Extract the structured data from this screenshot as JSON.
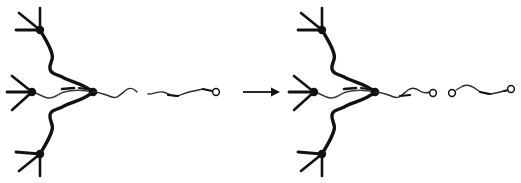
{
  "figure": {
    "title": "Polymer Chain-End Functionalization Reaction Scheme",
    "type": "hand-drawn reaction scheme",
    "background_color": "#ffffff",
    "ink_color": "#111111",
    "faint_ink_color": "#555555",
    "panel_count": 2,
    "operator_label": "→",
    "operator_name": "reaction-arrow"
  },
  "left_structure": {
    "name": "reactant-structure",
    "label": "reactant",
    "center_node_label": "core-junction",
    "arm_count": 3,
    "arms": [
      {
        "label": "upper-arm",
        "terminal_node_label": "upper-terminal-node",
        "terminal_ray_count": 3
      },
      {
        "label": "middle-arm",
        "terminal_node_label": "middle-terminal-node",
        "terminal_ray_count": 3
      },
      {
        "label": "lower-arm",
        "terminal_node_label": "lower-terminal-node",
        "terminal_ray_count": 3
      }
    ],
    "tail": {
      "label": "polymer-tail",
      "segment_count": 2,
      "open_circle_count": 1,
      "circle_labels": [
        "terminal-unit-1"
      ]
    }
  },
  "right_structure": {
    "name": "product-structure",
    "label": "product",
    "center_node_label": "core-junction",
    "arm_count": 3,
    "arms": [
      {
        "label": "upper-arm",
        "terminal_node_label": "upper-terminal-node",
        "terminal_ray_count": 3
      },
      {
        "label": "middle-arm",
        "terminal_node_label": "middle-terminal-node",
        "terminal_ray_count": 3
      },
      {
        "label": "lower-arm",
        "terminal_node_label": "lower-terminal-node",
        "terminal_ray_count": 3
      }
    ],
    "tail": {
      "label": "polymer-tail",
      "segment_count": 3,
      "open_circle_count": 3,
      "circle_labels": [
        "added-unit-1",
        "added-unit-2",
        "terminal-unit-3"
      ]
    }
  },
  "geometry": {
    "left_center": {
      "x": 93,
      "y": 92
    },
    "right_center": {
      "x": 375,
      "y": 92
    },
    "arrow_start_x": 243,
    "arrow_end_x": 279,
    "arrow_y": 92
  }
}
